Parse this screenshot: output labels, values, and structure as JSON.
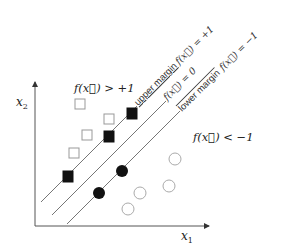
{
  "diagram": {
    "axes": {
      "x_label": "x",
      "x_sub": "1",
      "y_label": "x",
      "y_sub": "2"
    },
    "region_labels": {
      "positive": "f(x⃗) > +1",
      "negative": "f(x⃗) < −1"
    },
    "lines": {
      "upper": {
        "name": "upper margin",
        "equation": "f(x⃗) = +1"
      },
      "middle": {
        "name": "",
        "equation": "f(x⃗) = 0"
      },
      "lower": {
        "name": "lower margin",
        "equation": "f(x⃗) = −1"
      }
    },
    "points": {
      "open_squares": [
        [
          80,
          104
        ],
        [
          109,
          119
        ],
        [
          87,
          135
        ],
        [
          74,
          153
        ]
      ],
      "filled_squares": [
        [
          132,
          113
        ],
        [
          109,
          137
        ],
        [
          68,
          177
        ]
      ],
      "filled_circles": [
        [
          122,
          171
        ],
        [
          99,
          193
        ]
      ],
      "open_circles": [
        [
          175,
          159
        ],
        [
          169,
          186
        ],
        [
          140,
          193
        ],
        [
          128,
          209
        ]
      ]
    },
    "colors": {
      "axis": "#555555",
      "filled": "#111111",
      "open_stroke": "#999999"
    }
  }
}
